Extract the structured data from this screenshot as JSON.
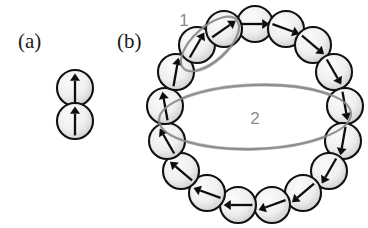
{
  "figure": {
    "width": 368,
    "height": 228,
    "background": "#ffffff",
    "panels": [
      {
        "id": "panel-a",
        "label": "(a)",
        "label_x": 18,
        "label_y": 48,
        "description": "two stacked spins both pointing up"
      },
      {
        "id": "panel-b",
        "label": "(b)",
        "label_x": 117,
        "label_y": 48,
        "description": "ring of spins with continuously rotating directions"
      }
    ]
  },
  "colors": {
    "disc_fill_light": "#f4f4f4",
    "disc_fill_shade": "#cfcfcf",
    "disc_stroke": "#111111",
    "arrow": "#0d0d0d",
    "annotation_stroke": "#8a8a8a",
    "annotation_label": "#8d8d8d",
    "text": "#1a1a1a"
  },
  "panel_a": {
    "radius": 18,
    "spins": [
      {
        "name": "spin-a-top",
        "cx": 75,
        "cy": 88,
        "angle_deg": 90,
        "direction": "up"
      },
      {
        "name": "spin-a-bottom",
        "cx": 75,
        "cy": 121,
        "angle_deg": 90,
        "direction": "up"
      }
    ]
  },
  "panel_b": {
    "ring_center_x": 255,
    "ring_center_y": 115,
    "ring_radius_x": 93,
    "ring_radius_y": 100,
    "disc_radius": 18,
    "spins": [
      {
        "name": "spin-b-01",
        "cx": 255,
        "cy": 24,
        "angle_deg": 0,
        "direction": "right"
      },
      {
        "name": "spin-b-02",
        "cx": 286,
        "cy": 29,
        "angle_deg": -20,
        "direction": "right-down"
      },
      {
        "name": "spin-b-03",
        "cx": 313,
        "cy": 45,
        "angle_deg": -40,
        "direction": "down-right"
      },
      {
        "name": "spin-b-04",
        "cx": 334,
        "cy": 72,
        "angle_deg": -60,
        "direction": "down-right-steep"
      },
      {
        "name": "spin-b-05",
        "cx": 345,
        "cy": 106,
        "angle_deg": -80,
        "direction": "down"
      },
      {
        "name": "spin-b-06",
        "cx": 343,
        "cy": 141,
        "angle_deg": -100,
        "direction": "down"
      },
      {
        "name": "spin-b-07",
        "cx": 329,
        "cy": 171,
        "angle_deg": -120,
        "direction": "down-left"
      },
      {
        "name": "spin-b-08",
        "cx": 303,
        "cy": 193,
        "angle_deg": -140,
        "direction": "down-left"
      },
      {
        "name": "spin-b-09",
        "cx": 272,
        "cy": 205,
        "angle_deg": -160,
        "direction": "left-down"
      },
      {
        "name": "spin-b-10",
        "cx": 238,
        "cy": 205,
        "angle_deg": 180,
        "direction": "left"
      },
      {
        "name": "spin-b-11",
        "cx": 207,
        "cy": 193,
        "angle_deg": 160,
        "direction": "left-up"
      },
      {
        "name": "spin-b-12",
        "cx": 181,
        "cy": 171,
        "angle_deg": 140,
        "direction": "up-left"
      },
      {
        "name": "spin-b-13",
        "cx": 167,
        "cy": 141,
        "angle_deg": 120,
        "direction": "up-left"
      },
      {
        "name": "spin-b-14",
        "cx": 165,
        "cy": 106,
        "angle_deg": 100,
        "direction": "up"
      },
      {
        "name": "spin-b-15",
        "cx": 176,
        "cy": 72,
        "angle_deg": 80,
        "direction": "up-right-steep"
      },
      {
        "name": "spin-b-16",
        "cx": 197,
        "cy": 45,
        "angle_deg": 60,
        "direction": "up-right"
      },
      {
        "name": "spin-b-17",
        "cx": 224,
        "cy": 29,
        "angle_deg": 35,
        "direction": "up-right"
      }
    ],
    "annotations": [
      {
        "name": "annotation-group-1",
        "label": "1",
        "label_x": 184,
        "label_y": 26,
        "cx": 210,
        "cy": 44,
        "rx": 36,
        "ry": 17,
        "rotate_deg": -42,
        "encircles": "two adjacent upper-left spins"
      },
      {
        "name": "annotation-group-2",
        "label": "2",
        "label_x": 255,
        "label_y": 124,
        "cx": 255,
        "cy": 117,
        "rx": 96,
        "ry": 32,
        "rotate_deg": -2,
        "encircles": "leftmost up spin and rightmost down spin"
      }
    ]
  }
}
